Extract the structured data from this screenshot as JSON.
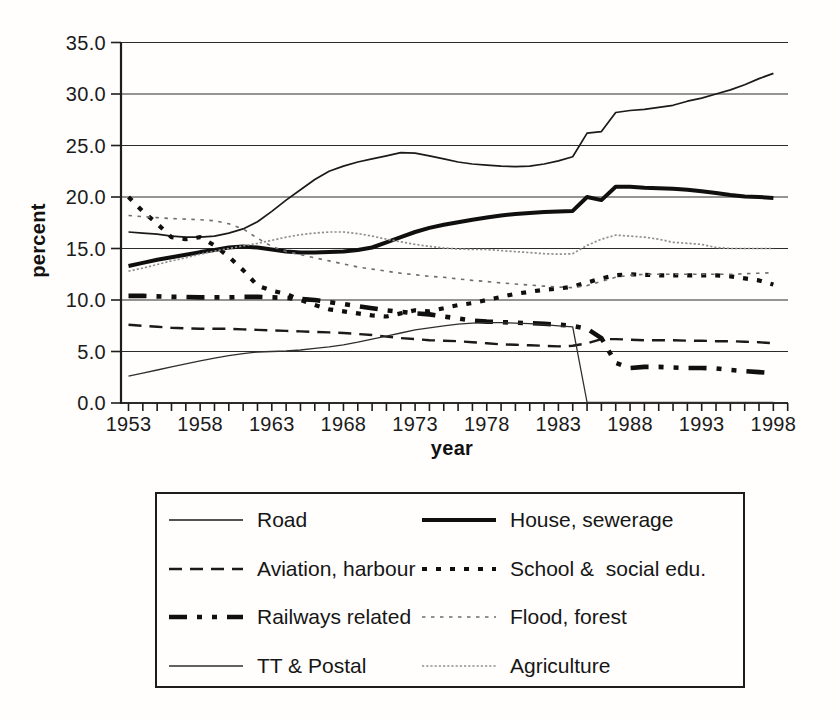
{
  "chart_data": {
    "type": "line",
    "title": "",
    "xlabel": "year",
    "ylabel": "percent",
    "ylim": [
      0,
      35
    ],
    "y_ticks": [
      0,
      5,
      10,
      15,
      20,
      25,
      30,
      35
    ],
    "y_tick_format": "one-decimal",
    "x_start": 1953,
    "x_step": 1,
    "x_end": 1998,
    "x_ticks_labeled": [
      1953,
      1958,
      1963,
      1968,
      1973,
      1978,
      1983,
      1988,
      1993,
      1998
    ],
    "grid": "horizontal",
    "legend_position": "boxed-below",
    "series": [
      {
        "id": "road",
        "label": "Road",
        "color": "#1a1a1a",
        "stroke_width": 1.7,
        "dash": "",
        "values": [
          16.6,
          16.5,
          16.4,
          16.2,
          16.1,
          16.1,
          16.2,
          16.5,
          16.9,
          17.6,
          18.6,
          19.7,
          20.7,
          21.7,
          22.5,
          23.0,
          23.4,
          23.7,
          24.0,
          24.3,
          24.25,
          24.0,
          23.7,
          23.4,
          23.2,
          23.1,
          23.0,
          22.95,
          23.0,
          23.2,
          23.5,
          23.9,
          26.2,
          26.35,
          28.2,
          28.4,
          28.5,
          28.7,
          28.9,
          29.3,
          29.6,
          30.0,
          30.4,
          30.9,
          31.5,
          32.0
        ]
      },
      {
        "id": "house_sewerage",
        "label": "House, sewerage",
        "color": "#0f0f0f",
        "stroke_width": 4,
        "dash": "",
        "values": [
          13.3,
          13.6,
          13.9,
          14.15,
          14.4,
          14.65,
          14.85,
          15.1,
          15.2,
          15.1,
          14.9,
          14.7,
          14.6,
          14.6,
          14.65,
          14.7,
          14.85,
          15.1,
          15.6,
          16.1,
          16.6,
          17.0,
          17.3,
          17.55,
          17.8,
          18.0,
          18.2,
          18.35,
          18.45,
          18.55,
          18.6,
          18.65,
          20.0,
          19.7,
          21.0,
          21.0,
          20.9,
          20.85,
          20.8,
          20.7,
          20.55,
          20.4,
          20.2,
          20.05,
          20.0,
          19.9
        ]
      },
      {
        "id": "aviation_harbour",
        "label": "Aviation, harbour",
        "color": "#1a1a1a",
        "stroke_width": 2.4,
        "dash": "13 8",
        "values": [
          7.6,
          7.5,
          7.4,
          7.3,
          7.25,
          7.2,
          7.2,
          7.2,
          7.15,
          7.1,
          7.05,
          7.0,
          6.95,
          6.9,
          6.85,
          6.8,
          6.7,
          6.6,
          6.45,
          6.3,
          6.2,
          6.1,
          6.05,
          6.0,
          5.9,
          5.8,
          5.7,
          5.65,
          5.6,
          5.55,
          5.5,
          5.55,
          5.8,
          6.2,
          6.2,
          6.15,
          6.1,
          6.1,
          6.1,
          6.05,
          6.05,
          6.0,
          6.0,
          5.95,
          5.9,
          5.8
        ]
      },
      {
        "id": "school_social_edu",
        "label": "School &  social edu.",
        "color": "#0f0f0f",
        "stroke_width": 4.2,
        "dash": "5 9",
        "values": [
          20.0,
          18.6,
          17.4,
          16.1,
          15.9,
          16.1,
          15.3,
          14.2,
          12.9,
          11.4,
          10.9,
          10.6,
          10.0,
          9.5,
          9.1,
          8.9,
          8.7,
          8.5,
          8.4,
          8.7,
          9.0,
          8.9,
          9.2,
          9.5,
          9.7,
          10.0,
          10.3,
          10.6,
          10.8,
          11.0,
          11.1,
          11.3,
          11.7,
          12.1,
          12.4,
          12.5,
          12.45,
          12.4,
          12.4,
          12.4,
          12.4,
          12.4,
          12.3,
          12.1,
          11.9,
          11.5
        ]
      },
      {
        "id": "railways_related",
        "label": "Railways related",
        "color": "#0f0f0f",
        "stroke_width": 4.6,
        "dash": "18 10 5 10 5 10",
        "values": [
          10.4,
          10.4,
          10.35,
          10.3,
          10.3,
          10.25,
          10.25,
          10.25,
          10.3,
          10.3,
          10.25,
          10.2,
          10.1,
          10.0,
          9.8,
          9.6,
          9.4,
          9.2,
          9.0,
          8.85,
          8.7,
          8.6,
          8.4,
          8.2,
          8.0,
          7.9,
          7.85,
          7.8,
          7.75,
          7.7,
          7.6,
          7.5,
          7.2,
          6.3,
          3.9,
          3.4,
          3.5,
          3.5,
          3.45,
          3.4,
          3.4,
          3.35,
          3.2,
          3.1,
          3.0,
          2.9
        ]
      },
      {
        "id": "flood_forest",
        "label": "Flood, forest",
        "color": "#6e6e6e",
        "stroke_width": 1.6,
        "dash": "3.5 5.5",
        "values": [
          18.2,
          18.1,
          18.0,
          17.9,
          17.85,
          17.8,
          17.7,
          17.4,
          16.9,
          16.0,
          15.2,
          14.7,
          14.4,
          14.1,
          13.8,
          13.5,
          13.2,
          13.0,
          12.8,
          12.6,
          12.45,
          12.3,
          12.2,
          12.05,
          11.9,
          11.8,
          11.65,
          11.55,
          11.45,
          11.35,
          11.25,
          11.2,
          11.4,
          11.8,
          12.2,
          12.4,
          12.5,
          12.5,
          12.5,
          12.5,
          12.5,
          12.5,
          12.5,
          12.55,
          12.6,
          12.65
        ]
      },
      {
        "id": "tt_postal",
        "label": "TT & Postal",
        "color": "#2e2e2e",
        "stroke_width": 1.3,
        "dash": "",
        "values": [
          2.6,
          2.9,
          3.2,
          3.5,
          3.8,
          4.1,
          4.35,
          4.6,
          4.8,
          4.95,
          5.0,
          5.05,
          5.15,
          5.3,
          5.45,
          5.65,
          5.9,
          6.2,
          6.5,
          6.8,
          7.1,
          7.3,
          7.5,
          7.65,
          7.75,
          7.8,
          7.8,
          7.75,
          7.7,
          7.6,
          7.5,
          7.4,
          0.05,
          0.05,
          0.05,
          0.05,
          0.05,
          0.05,
          0.05,
          0.05,
          0.05,
          0.05,
          0.05,
          0.05,
          0.05,
          0.05
        ]
      },
      {
        "id": "agriculture",
        "label": "Agriculture",
        "color": "#909090",
        "stroke_width": 1.7,
        "dash": "2.2 2",
        "values": [
          12.8,
          13.1,
          13.45,
          13.8,
          14.1,
          14.45,
          14.75,
          15.0,
          15.25,
          15.5,
          15.8,
          16.1,
          16.35,
          16.5,
          16.6,
          16.6,
          16.45,
          16.2,
          15.9,
          15.65,
          15.4,
          15.2,
          15.05,
          14.95,
          14.9,
          14.9,
          14.8,
          14.7,
          14.6,
          14.5,
          14.45,
          14.5,
          15.3,
          15.9,
          16.3,
          16.2,
          16.1,
          15.9,
          15.6,
          15.5,
          15.4,
          15.1,
          15.0,
          15.0,
          15.0,
          15.0
        ]
      }
    ],
    "legend_rows": [
      [
        "road",
        "house_sewerage"
      ],
      [
        "aviation_harbour",
        "school_social_edu"
      ],
      [
        "railways_related",
        "flood_forest"
      ],
      [
        "tt_postal",
        "agriculture"
      ]
    ]
  }
}
